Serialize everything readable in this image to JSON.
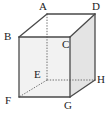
{
  "figure": {
    "kind": "geometry-diagram",
    "shape_name": "cube",
    "canvas": {
      "width": 110,
      "height": 115
    },
    "background_color": "#ffffff",
    "stroke_color": "#4a4a4a",
    "hidden_stroke_color": "#6e6e6e",
    "front_face_fill": "#f2f2f2",
    "right_face_fill": "#e4e4e4",
    "top_face_fill": "#ffffff"
  },
  "vertices": [
    {
      "id": "A",
      "label": "A",
      "x": 47,
      "y": 14,
      "label_x": 39,
      "label_y": 1,
      "hidden": false,
      "role": "back-top-left"
    },
    {
      "id": "D",
      "label": "D",
      "x": 95,
      "y": 14,
      "label_x": 92,
      "label_y": 1,
      "hidden": false,
      "role": "back-top-right"
    },
    {
      "id": "B",
      "label": "B",
      "x": 19,
      "y": 37,
      "label_x": 4,
      "label_y": 31,
      "hidden": false,
      "role": "front-top-left"
    },
    {
      "id": "C",
      "label": "C",
      "x": 70,
      "y": 37,
      "label_x": 62,
      "label_y": 39,
      "hidden": false,
      "role": "front-top-right"
    },
    {
      "id": "E",
      "label": "E",
      "x": 47,
      "y": 80,
      "label_x": 34,
      "label_y": 69,
      "hidden": true,
      "role": "back-bottom-left"
    },
    {
      "id": "H",
      "label": "H",
      "x": 95,
      "y": 80,
      "label_x": 97,
      "label_y": 74,
      "hidden": false,
      "role": "back-bottom-right"
    },
    {
      "id": "F",
      "label": "F",
      "x": 19,
      "y": 97,
      "label_x": 5,
      "label_y": 95,
      "hidden": false,
      "role": "front-bottom-left"
    },
    {
      "id": "G",
      "label": "G",
      "x": 70,
      "y": 97,
      "label_x": 64,
      "label_y": 100,
      "hidden": false,
      "role": "front-bottom-right"
    }
  ],
  "faces": [
    {
      "id": "front",
      "points": "19,37 70,37 70,97 19,97",
      "fill": "#f2f2f2"
    },
    {
      "id": "right",
      "points": "70,37 95,14 95,80 70,97",
      "fill": "#e4e4e4"
    },
    {
      "id": "top",
      "points": "19,37 47,14 95,14 70,37",
      "fill": "#ffffff"
    }
  ],
  "edges": [
    {
      "id": "A-D",
      "from": "A",
      "to": "D",
      "hidden": false
    },
    {
      "id": "A-B",
      "from": "A",
      "to": "B",
      "hidden": false
    },
    {
      "id": "B-C",
      "from": "B",
      "to": "C",
      "hidden": false
    },
    {
      "id": "C-D",
      "from": "C",
      "to": "D",
      "hidden": false
    },
    {
      "id": "B-F",
      "from": "B",
      "to": "F",
      "hidden": false
    },
    {
      "id": "C-G",
      "from": "C",
      "to": "G",
      "hidden": false
    },
    {
      "id": "D-H",
      "from": "D",
      "to": "H",
      "hidden": false
    },
    {
      "id": "F-G",
      "from": "F",
      "to": "G",
      "hidden": false
    },
    {
      "id": "G-H",
      "from": "G",
      "to": "H",
      "hidden": false
    },
    {
      "id": "A-E",
      "from": "A",
      "to": "E",
      "hidden": true
    },
    {
      "id": "E-F",
      "from": "E",
      "to": "F",
      "hidden": true
    },
    {
      "id": "E-H",
      "from": "E",
      "to": "H",
      "hidden": true
    }
  ]
}
